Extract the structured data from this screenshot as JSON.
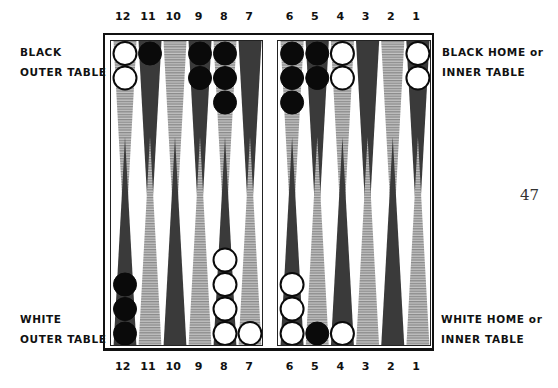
{
  "page_number": "47",
  "labels": {
    "black_outer": [
      "BLACK",
      "OUTER TABLE"
    ],
    "black_home": [
      "BLACK HOME or",
      "INNER TABLE"
    ],
    "white_outer": [
      "WHITE",
      "OUTER TABLE"
    ],
    "white_home": [
      "WHITE HOME or",
      "INNER TABLE"
    ]
  },
  "point_numbers": {
    "left": [
      "12",
      "11",
      "10",
      "9",
      "8",
      "7"
    ],
    "right": [
      "6",
      "5",
      "4",
      "3",
      "2",
      "1"
    ]
  },
  "colors": {
    "dark_point": "#3a3a3a",
    "hatched_point": "#9a9a9a",
    "black_checker": "#0a0a0a",
    "white_checker": "#ffffff"
  },
  "board": {
    "top": {
      "left": [
        {
          "point": "12",
          "style": "hatched",
          "checkers": {
            "color": "white",
            "count": 2
          }
        },
        {
          "point": "11",
          "style": "dark",
          "checkers": {
            "color": "black",
            "count": 1
          }
        },
        {
          "point": "10",
          "style": "hatched",
          "checkers": {
            "color": "none",
            "count": 0
          }
        },
        {
          "point": "9",
          "style": "dark",
          "checkers": {
            "color": "black",
            "count": 2
          }
        },
        {
          "point": "8",
          "style": "hatched",
          "checkers": {
            "color": "black",
            "count": 3
          }
        },
        {
          "point": "7",
          "style": "dark",
          "checkers": {
            "color": "none",
            "count": 0
          }
        }
      ],
      "right": [
        {
          "point": "6",
          "style": "hatched",
          "checkers": {
            "color": "black",
            "count": 3
          }
        },
        {
          "point": "5",
          "style": "dark",
          "checkers": {
            "color": "black",
            "count": 2
          }
        },
        {
          "point": "4",
          "style": "hatched",
          "checkers": {
            "color": "white",
            "count": 2
          }
        },
        {
          "point": "3",
          "style": "dark",
          "checkers": {
            "color": "none",
            "count": 0
          }
        },
        {
          "point": "2",
          "style": "hatched",
          "checkers": {
            "color": "none",
            "count": 0
          }
        },
        {
          "point": "1",
          "style": "dark",
          "checkers": {
            "color": "white",
            "count": 2
          }
        }
      ]
    },
    "bottom": {
      "left": [
        {
          "point": "12",
          "style": "dark",
          "checkers": {
            "color": "black",
            "count": 3
          }
        },
        {
          "point": "11",
          "style": "hatched",
          "checkers": {
            "color": "none",
            "count": 0
          }
        },
        {
          "point": "10",
          "style": "dark",
          "checkers": {
            "color": "none",
            "count": 0
          }
        },
        {
          "point": "9",
          "style": "hatched",
          "checkers": {
            "color": "none",
            "count": 0
          }
        },
        {
          "point": "8",
          "style": "dark",
          "checkers": {
            "color": "white",
            "count": 4
          }
        },
        {
          "point": "7",
          "style": "hatched",
          "checkers": {
            "color": "white",
            "count": 1
          }
        }
      ],
      "right": [
        {
          "point": "6",
          "style": "dark",
          "checkers": {
            "color": "white",
            "count": 3
          }
        },
        {
          "point": "5",
          "style": "hatched",
          "checkers": {
            "color": "black",
            "count": 1
          }
        },
        {
          "point": "4",
          "style": "dark",
          "checkers": {
            "color": "white",
            "count": 1
          }
        },
        {
          "point": "3",
          "style": "hatched",
          "checkers": {
            "color": "none",
            "count": 0
          }
        },
        {
          "point": "2",
          "style": "dark",
          "checkers": {
            "color": "none",
            "count": 0
          }
        },
        {
          "point": "1",
          "style": "hatched",
          "checkers": {
            "color": "none",
            "count": 0
          }
        }
      ]
    }
  }
}
